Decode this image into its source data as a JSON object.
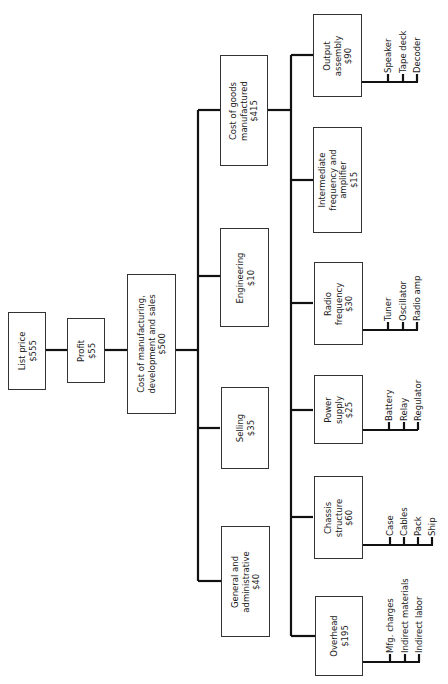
{
  "diagram": {
    "type": "cost-breakdown-tree",
    "orientation": "rotated-90-ccw",
    "root": {
      "list_price": {
        "label": "List price",
        "value": "$555"
      },
      "profit": {
        "label": "Profit",
        "value": "$55"
      },
      "cost_total": {
        "label_line1": "Cost of manufacturing,",
        "label_line2": "development and sales",
        "value": "$500"
      }
    },
    "level2": {
      "cost_of_goods": {
        "label_line1": "Cost of goods",
        "label_line2": "manufactured",
        "value": "$415"
      },
      "engineering": {
        "label": "Engineering",
        "value": "$10"
      },
      "selling": {
        "label": "Selling",
        "value": "$35"
      },
      "general_admin": {
        "label_line1": "General and",
        "label_line2": "administrative",
        "value": "$40"
      }
    },
    "level3": {
      "output_assembly": {
        "label_line1": "Output",
        "label_line2": "assembly",
        "value": "$90",
        "items": [
          "Speaker",
          "Tape deck",
          "Decoder"
        ]
      },
      "if_amplifier": {
        "label_line1": "Intermediate",
        "label_line2": "frequency and",
        "label_line3": "amplifier",
        "value": "$15"
      },
      "radio_frequency": {
        "label_line1": "Radio",
        "label_line2": "frequency",
        "value": "$30",
        "items": [
          "Tuner",
          "Oscillator",
          "Radio amp"
        ]
      },
      "power_supply": {
        "label_line1": "Power",
        "label_line2": "supply",
        "value": "$25",
        "items": [
          "Battery",
          "Relay",
          "Regulator"
        ]
      },
      "chassis": {
        "label_line1": "Chassis",
        "label_line2": "structure",
        "value": "$60",
        "items": [
          "Case",
          "Cables",
          "Pack",
          "Ship"
        ]
      },
      "overhead": {
        "label": "Overhead",
        "value": "$195",
        "items": [
          "Mfg. charges",
          "Indirect materials",
          "Indirect labor"
        ]
      }
    }
  }
}
